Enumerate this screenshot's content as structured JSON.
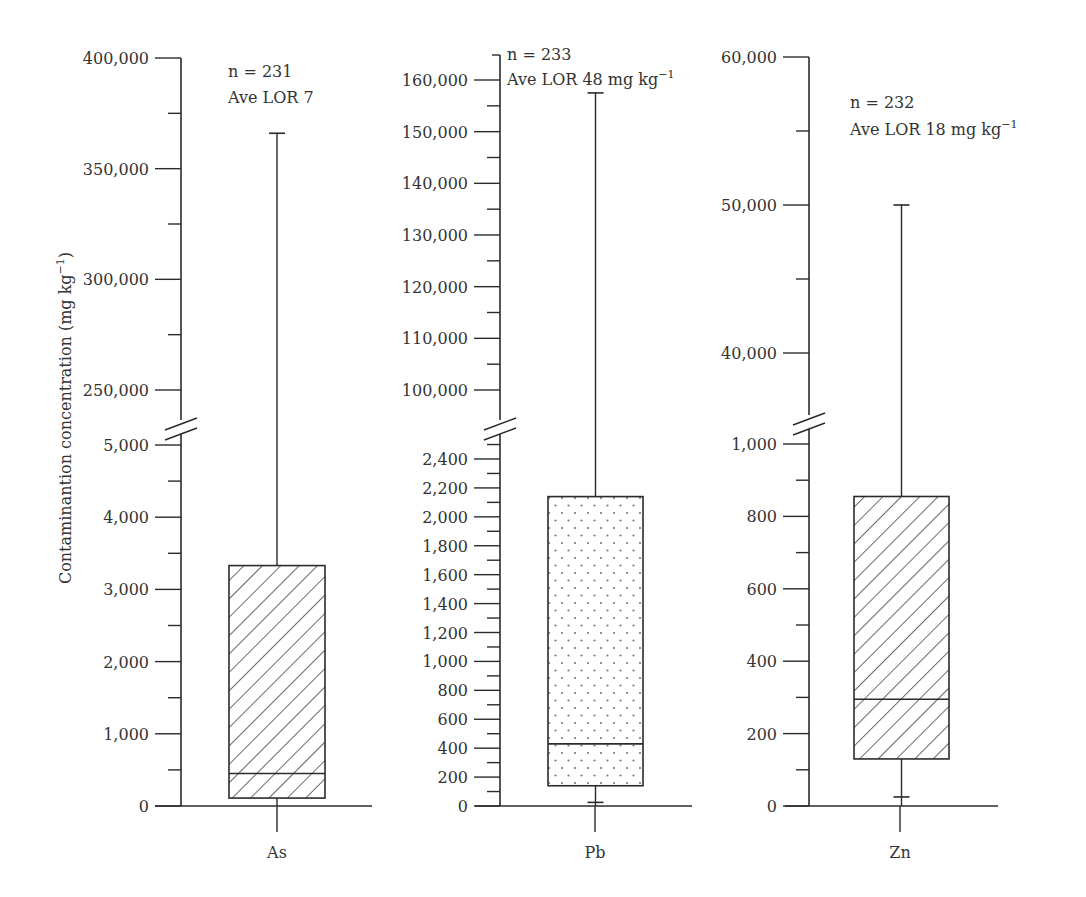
{
  "chart_data": {
    "type": "box",
    "title": "",
    "ylabel": "Contaminantion concentration (mg kg−1)",
    "ylabel_main": "Contaminantion concentration (mg kg",
    "ylabel_sup": "−1",
    "ylabel_close": ")",
    "categories": [
      "As",
      "Pb",
      "Zn"
    ],
    "panels": [
      {
        "category": "As",
        "annotation": {
          "n": "n = 231",
          "lor": "Ave LOR 7",
          "lor_sup": ""
        },
        "pattern": "diagonal-hatch",
        "axis_break": {
          "lower_max": 5000,
          "upper_min": 250000
        },
        "lower_ticks": [
          0,
          1000,
          2000,
          3000,
          4000,
          5000
        ],
        "lower_tick_labels": [
          "0",
          "1,000",
          "2,000",
          "3,000",
          "4,000",
          "5,000"
        ],
        "upper_ticks": [
          250000,
          300000,
          350000,
          400000
        ],
        "upper_tick_labels": [
          "250,000",
          "300,000",
          "350,000",
          "400,000"
        ],
        "whisker_low": 0,
        "q1": 110,
        "median": 450,
        "q3": 3330,
        "whisker_high": 366000
      },
      {
        "category": "Pb",
        "annotation": {
          "n": "n = 233",
          "lor": "Ave LOR 48 mg kg",
          "lor_sup": "−1"
        },
        "pattern": "dots",
        "axis_break": {
          "lower_max": 2500,
          "upper_min": 95000
        },
        "lower_ticks": [
          0,
          200,
          400,
          600,
          800,
          1000,
          1200,
          1400,
          1600,
          1800,
          2000,
          2200,
          2400
        ],
        "lower_tick_labels": [
          "0",
          "200",
          "400",
          "600",
          "800",
          "1,000",
          "1,200",
          "1,400",
          "1,600",
          "1,800",
          "2,000",
          "2,200",
          "2,400"
        ],
        "upper_ticks": [
          100000,
          110000,
          120000,
          130000,
          140000,
          150000,
          160000
        ],
        "upper_tick_labels": [
          "100,000",
          "110,000",
          "120,000",
          "130,000",
          "140,000",
          "150,000",
          "160,000"
        ],
        "whisker_low": 25,
        "q1": 140,
        "median": 430,
        "q3": 2140,
        "whisker_high": 157500
      },
      {
        "category": "Zn",
        "annotation": {
          "n": "n = 232",
          "lor": "Ave LOR 18 mg kg",
          "lor_sup": "−1"
        },
        "pattern": "diagonal-hatch",
        "axis_break": {
          "lower_max": 1000,
          "upper_min": 35000
        },
        "lower_ticks": [
          0,
          200,
          400,
          600,
          800,
          1000
        ],
        "lower_tick_labels": [
          "0",
          "200",
          "400",
          "600",
          "800",
          "1,000"
        ],
        "upper_ticks": [
          40000,
          50000,
          60000
        ],
        "upper_tick_labels": [
          "40,000",
          "50,000",
          "60,000"
        ],
        "whisker_low": 25,
        "q1": 130,
        "median": 295,
        "q3": 855,
        "whisker_high": 50000
      }
    ],
    "grid": false,
    "legend": null
  },
  "colors": {
    "line": "#2b2b2b",
    "background": "#ffffff",
    "dot": "#777777"
  }
}
